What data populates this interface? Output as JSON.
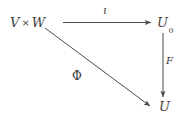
{
  "diagram": {
    "type": "commutative-diagram",
    "background_color": "#ffffff",
    "ink_color": "#3d3d3d",
    "nodes": [
      {
        "id": "source",
        "label_main": "V",
        "label_op": "×",
        "label_second": "W",
        "full_text": "V × W",
        "position": "top-left"
      },
      {
        "id": "target0",
        "label_main": "U",
        "subscript": "0",
        "full_text": "U₀",
        "position": "top-right"
      },
      {
        "id": "target",
        "label_main": "U",
        "full_text": "U",
        "position": "bottom-right"
      }
    ],
    "arrows": [
      {
        "id": "iota",
        "label": "ι",
        "from": "source",
        "to": "target0",
        "direction": "horizontal-right"
      },
      {
        "id": "f",
        "label": "F",
        "from": "target0",
        "to": "target",
        "direction": "vertical-down"
      },
      {
        "id": "phi",
        "label": "Φ",
        "from": "source",
        "to": "target",
        "direction": "diagonal-down-right"
      }
    ]
  }
}
